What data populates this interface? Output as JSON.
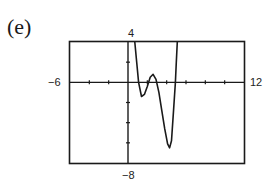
{
  "panel_label": "(e)",
  "window": {
    "xmin_label": "−6",
    "xmax_label": "12",
    "ymax_label": "4",
    "ymin_label": "−8"
  },
  "chart_data": {
    "type": "line",
    "title": "(e)",
    "xlabel": "",
    "ylabel": "",
    "xlim": [
      -6,
      12
    ],
    "ylim": [
      -8,
      4
    ],
    "xscale_ticks": 2,
    "yscale_ticks": 2,
    "grid": false,
    "series": [
      {
        "name": "f(x)",
        "x": [
          0.7,
          0.9,
          1.1,
          1.4,
          1.7,
          2.0,
          2.3,
          2.6,
          2.9,
          3.2,
          3.5,
          3.8,
          4.1,
          4.3,
          4.5,
          4.7,
          4.9,
          5.0,
          5.1
        ],
        "y": [
          4.0,
          2.0,
          0.0,
          -1.4,
          -1.2,
          -0.4,
          0.5,
          0.8,
          0.3,
          -1.0,
          -2.8,
          -4.6,
          -6.1,
          -6.5,
          -5.8,
          -3.0,
          0.0,
          2.0,
          4.0
        ]
      }
    ]
  }
}
